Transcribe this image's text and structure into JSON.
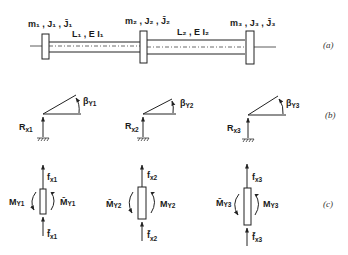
{
  "figure": {
    "parts": [
      {
        "id": "a",
        "label": "(a)"
      },
      {
        "id": "b",
        "label": "(b)"
      },
      {
        "id": "c",
        "label": "(c)"
      }
    ],
    "shaft": {
      "disks": [
        {
          "label": "m₁ , J₁ , J̄₁"
        },
        {
          "label": "m₂ , J₂ , J̄₂"
        },
        {
          "label": "m₃ , J₃ , J̄₃"
        }
      ],
      "segments": [
        {
          "label": "L₁ , E I₁"
        },
        {
          "label": "L₂ , E I₂"
        }
      ]
    },
    "supports": [
      {
        "force": "R",
        "force_sub": "x1",
        "angle": "β",
        "angle_sub": "Y1"
      },
      {
        "force": "R",
        "force_sub": "x2",
        "angle": "β",
        "angle_sub": "Y2"
      },
      {
        "force": "R",
        "force_sub": "x3",
        "angle": "β",
        "angle_sub": "Y3"
      }
    ],
    "free_bodies": [
      {
        "f_top": "f",
        "f_top_sub": "x1",
        "f_bot": "f̄",
        "f_bot_sub": "x1",
        "m_left": "M",
        "m_left_sub": "Y1",
        "m_right": "M̄",
        "m_right_sub": "Y1"
      },
      {
        "f_top": "f",
        "f_top_sub": "x2",
        "f_bot": "f̄",
        "f_bot_sub": "x2",
        "m_left": "M̄",
        "m_left_sub": "Y2",
        "m_right": "M",
        "m_right_sub": "Y2"
      },
      {
        "f_top": "f",
        "f_top_sub": "x3",
        "f_bot": "f̄",
        "f_bot_sub": "x3",
        "m_left": "M̄",
        "m_left_sub": "Y3",
        "m_right": "M",
        "m_right_sub": "Y3"
      }
    ]
  }
}
